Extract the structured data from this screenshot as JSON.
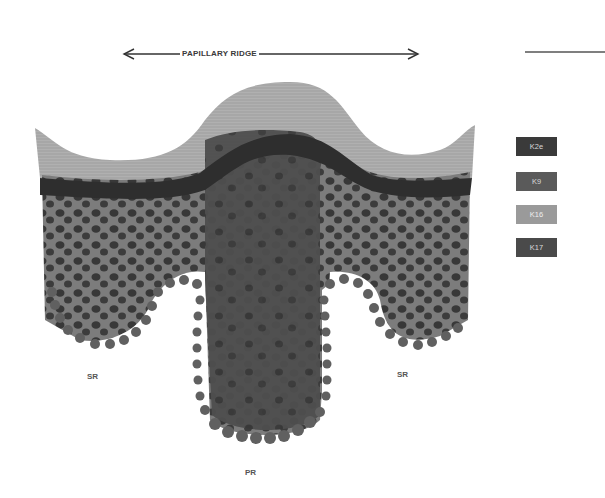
{
  "diagram": {
    "title_arrow_label": "PAPILLARY RIDGE",
    "legend": [
      {
        "label": "K2e",
        "color": "#3a3a3a"
      },
      {
        "label": "K9",
        "color": "#5a5a5a"
      },
      {
        "label": "K16",
        "color": "#9a9a9a"
      },
      {
        "label": "K17",
        "color": "#4a4a4a"
      }
    ],
    "region_labels": {
      "left_sr": "SR",
      "right_sr": "SR",
      "bottom_pr": "PR"
    },
    "layers": {
      "stratum_corneum_color": "#a8a8a8",
      "granular_band_color": "#2e2e2e",
      "suprabasal_color": "#7a7a7a",
      "primary_ridge_color": "#4a4a4a",
      "nucleus_color": "#353535",
      "basal_cell_color": "#606060"
    }
  }
}
